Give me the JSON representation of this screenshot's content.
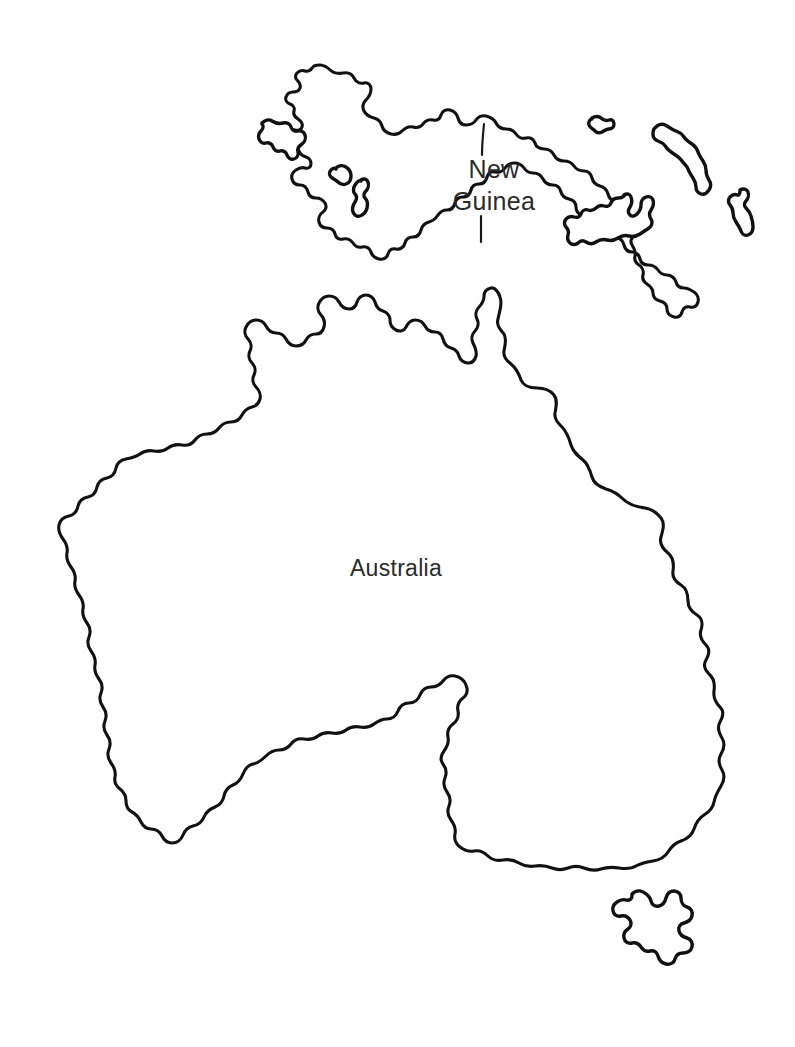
{
  "map": {
    "title": "Australia and New Guinea outline map",
    "background_color": "#ffffff",
    "outline_color": "#111111",
    "label_color": "#2b2b2b",
    "style": "blank outline / coloring map, no fill, no graticule",
    "labels": [
      {
        "id": "australia",
        "text": "Australia",
        "x": 396,
        "y": 576,
        "font_size": 23
      },
      {
        "id": "new-guinea-line1",
        "text": "New",
        "x": 494,
        "y": 178,
        "font_size": 25
      },
      {
        "id": "new-guinea-line2",
        "text": "Guinea",
        "x": 494,
        "y": 210,
        "font_size": 25
      }
    ],
    "landmasses": [
      {
        "id": "australia-mainland",
        "name": "Australia"
      },
      {
        "id": "tasmania",
        "name": "Tasmania"
      },
      {
        "id": "new-guinea",
        "name": "New Guinea"
      },
      {
        "id": "halmahera",
        "name": "Halmahera"
      },
      {
        "id": "waigeo",
        "name": "Waigeo"
      },
      {
        "id": "misool",
        "name": "Misool"
      },
      {
        "id": "manus",
        "name": "Manus Island"
      },
      {
        "id": "new-britain",
        "name": "New Britain"
      },
      {
        "id": "new-ireland",
        "name": "New Ireland"
      },
      {
        "id": "bougainville",
        "name": "Bougainville"
      }
    ],
    "borders": [
      {
        "id": "indonesia-png-border",
        "name": "Indonesia / Papua New Guinea border"
      }
    ]
  }
}
